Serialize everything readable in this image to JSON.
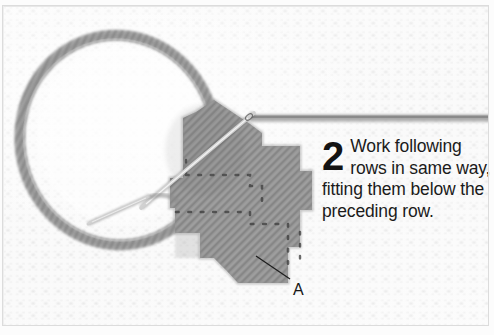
{
  "figure": {
    "kind": "needlework-instruction-photo",
    "width": 494,
    "height": 335,
    "technique": "tent stitch / half cross stitch on canvas"
  },
  "caption": {
    "step_number": "2",
    "text": "Work following rows in same way, fitting them below the preceding row.",
    "lines": [
      "Work",
      "following",
      "rows in same",
      "way, fitting them",
      "below the",
      "preceding row."
    ]
  },
  "annotations": [
    {
      "id": "a",
      "label": "A",
      "meaning": "preceding row of stitches",
      "leader_from": [
        289,
        279
      ],
      "leader_to": [
        258,
        258
      ]
    }
  ],
  "elements": {
    "thread_loop": "large oval of working thread looping to the upper left",
    "needle": "tapestry needle passing diagonally through the canvas",
    "second_needle_tip": "needle tip emerging at lower left of stitched block",
    "working_thread": "thread running horizontally off to the right edge",
    "stitch_block": "stepped diagonal rows of grey tent stitches"
  },
  "colors": {
    "fabric": "#fdfdfd",
    "fabric_grid": "#c9c9c9",
    "thread": "#8d8d8d",
    "thread_dark": "#6f6f6f",
    "thread_light": "#a8a8a8",
    "needle": "#d9d9d9",
    "needle_edge": "#5e5e5e",
    "text": "#1b1b1b",
    "border": "#dcdcdc"
  },
  "icons": {
    "needle": "needle-icon",
    "thread_loop": "thread-loop-icon",
    "stitch_block": "stitch-block-icon",
    "leader_line": "leader-line-icon"
  }
}
